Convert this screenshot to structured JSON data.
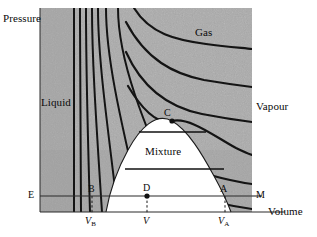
{
  "figure": {
    "title_implicit": "Pressure-Volume phase diagram with isotherms",
    "axes": {
      "y_label": "Pressure",
      "x_label": "Volume"
    },
    "regions": [
      {
        "name": "liquid",
        "label": "Liquid"
      },
      {
        "name": "gas",
        "label": "Gas"
      },
      {
        "name": "vapour",
        "label": "Vapour"
      },
      {
        "name": "mixture",
        "label": "Mixture"
      }
    ],
    "points": [
      {
        "name": "critical-point",
        "label": "C"
      },
      {
        "name": "point-b",
        "label": "B"
      },
      {
        "name": "point-d",
        "label": "D"
      },
      {
        "name": "point-a",
        "label": "A"
      },
      {
        "name": "point-e",
        "label": "E"
      },
      {
        "name": "point-m",
        "label": "M"
      }
    ],
    "tick_labels": [
      {
        "name": "v-b",
        "symbol": "V",
        "subscript": "B"
      },
      {
        "name": "v",
        "symbol": "V",
        "subscript": ""
      },
      {
        "name": "v-a",
        "symbol": "V",
        "subscript": "A"
      }
    ],
    "colors": {
      "plot_background": "#b0b0b0",
      "curve": "#141414",
      "dome_fill": "#ffffff",
      "tie_line": "#101010",
      "isobar": "#404040",
      "text": "#0a0a0a",
      "page_background": "#ffffff"
    }
  }
}
